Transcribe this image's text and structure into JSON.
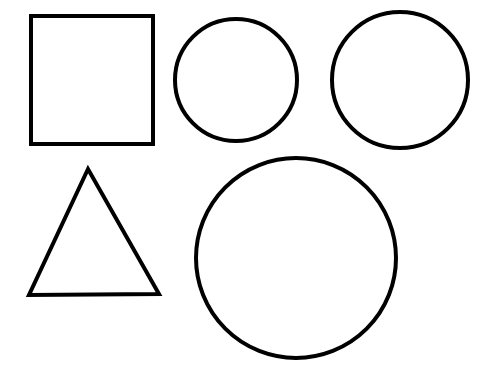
{
  "diagram": {
    "background": "#ffffff",
    "stroke_color": "#000000",
    "stroke_width": 4,
    "shapes": [
      {
        "kind": "square",
        "x": 31,
        "y": 16,
        "width": 122,
        "height": 128
      },
      {
        "kind": "circle",
        "cx": 236,
        "cy": 80,
        "r": 61
      },
      {
        "kind": "circle",
        "cx": 400,
        "cy": 80,
        "r": 68
      },
      {
        "kind": "triangle",
        "points": "88,169 29,295 159,294"
      },
      {
        "kind": "circle",
        "cx": 296,
        "cy": 258,
        "r": 100
      }
    ]
  }
}
